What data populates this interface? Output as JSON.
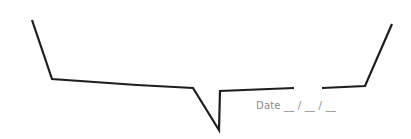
{
  "speech_bubble": {
    "stroke_color": "#1e1e1e",
    "stroke_width": 2.2,
    "outline_left_path": "M32,20 L52,79 L137,85 L193,88 L219,130 L220,91 L294,88",
    "outline_right_path": "M322,88 L365,86 L392,24"
  },
  "date_field": {
    "label": "Date __ / __ / __",
    "color": "#8a8a8a"
  }
}
